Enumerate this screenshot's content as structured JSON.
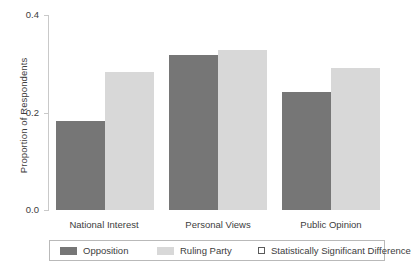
{
  "chart_data": {
    "type": "bar",
    "title": "",
    "xlabel": "",
    "ylabel": "Proportion of Respondents",
    "categories": [
      "National Interest",
      "Personal Views",
      "Public Opinion"
    ],
    "series": [
      {
        "name": "Opposition",
        "color": "#767676",
        "values": [
          0.183,
          0.317,
          0.243
        ]
      },
      {
        "name": "Ruling Party",
        "color": "#d8d8d8",
        "values": [
          0.283,
          0.329,
          0.292
        ]
      }
    ],
    "ylim": [
      0.0,
      0.4
    ],
    "yticks": [
      0.0,
      0.2,
      0.4
    ],
    "ytick_labels": [
      "0.0",
      "0.2",
      "0.4"
    ],
    "grid": false,
    "legend_position": "bottom",
    "legend_entries": [
      {
        "label": "Opposition",
        "marker": "filled-square",
        "color": "#767676"
      },
      {
        "label": "Ruling Party",
        "marker": "filled-square",
        "color": "#d8d8d8"
      },
      {
        "label": "Statistically Significant Difference",
        "marker": "hollow-square",
        "color": "#ffffff"
      }
    ]
  },
  "axis": {
    "ytick_0": "0.0",
    "ytick_1": "0.2",
    "ytick_2": "0.4",
    "ylabel": "Proportion of Respondents"
  },
  "xticks": {
    "g0": "National Interest",
    "g1": "Personal Views",
    "g2": "Public Opinion"
  },
  "legend": {
    "item0": "Opposition",
    "item1": "Ruling Party",
    "item2": "Statistically Significant Difference"
  }
}
